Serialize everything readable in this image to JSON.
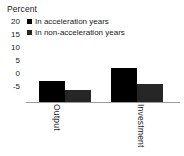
{
  "chart_data": {
    "type": "bar",
    "title": "",
    "subtitle": "",
    "xlabel": "",
    "ylabel": "Percent",
    "categories": [
      "Output",
      "Investment"
    ],
    "series": [
      {
        "name": "In acceleration years",
        "values": [
          7,
          11
        ],
        "color": "#000000"
      },
      {
        "name": "In non-acceleration years",
        "values": [
          4,
          6
        ],
        "color": "#262626"
      }
    ],
    "ylim": [
      -5,
      20
    ],
    "yticks": [
      20,
      15,
      10,
      5,
      0,
      -5
    ],
    "ytick_labels": [
      "20",
      "15",
      "10",
      "5",
      "0",
      "-5"
    ],
    "grid": false,
    "legend_position": "top-left",
    "zero_line_color": "#9a9a9a",
    "background_color": "#ffffff",
    "text_color": "#1a1a1a"
  },
  "axis": {
    "unit_label": "Percent"
  },
  "legend": {
    "entries": [
      {
        "label": "In acceleration years"
      },
      {
        "label": "In non-acceleration years"
      }
    ]
  },
  "ticks": {
    "t0": "20",
    "t1": "15",
    "t2": "10",
    "t3": "5",
    "t4": "0",
    "t5": "-5"
  },
  "categories": {
    "c0": "Output",
    "c1": "Investment"
  }
}
